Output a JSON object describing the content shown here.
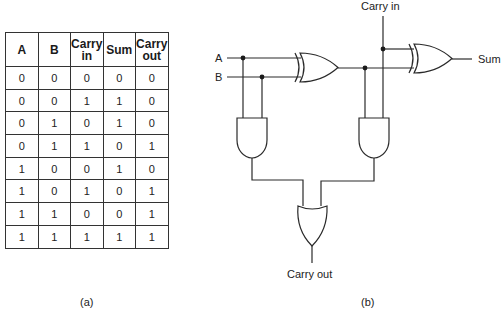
{
  "truth_table": {
    "headers": [
      "A",
      "B",
      "Carry\nin",
      "Sum",
      "Carry\nout"
    ],
    "header_lines": [
      [
        "A"
      ],
      [
        "B"
      ],
      [
        "Carry",
        "in"
      ],
      [
        "Sum"
      ],
      [
        "Carry",
        "out"
      ]
    ],
    "rows": [
      [
        "0",
        "0",
        "0",
        "0",
        "0"
      ],
      [
        "0",
        "0",
        "1",
        "1",
        "0"
      ],
      [
        "0",
        "1",
        "0",
        "1",
        "0"
      ],
      [
        "0",
        "1",
        "1",
        "0",
        "1"
      ],
      [
        "1",
        "0",
        "0",
        "1",
        "0"
      ],
      [
        "1",
        "0",
        "1",
        "0",
        "1"
      ],
      [
        "1",
        "1",
        "0",
        "0",
        "1"
      ],
      [
        "1",
        "1",
        "1",
        "1",
        "1"
      ]
    ]
  },
  "captions": {
    "a": "(a)",
    "b": "(b)"
  },
  "circuit": {
    "inputs": {
      "a": "A",
      "b": "B",
      "carry_in": "Carry in"
    },
    "outputs": {
      "sum": "Sum",
      "carry_out": "Carry out"
    },
    "gates": [
      "XOR",
      "XOR",
      "AND",
      "AND",
      "OR"
    ]
  }
}
